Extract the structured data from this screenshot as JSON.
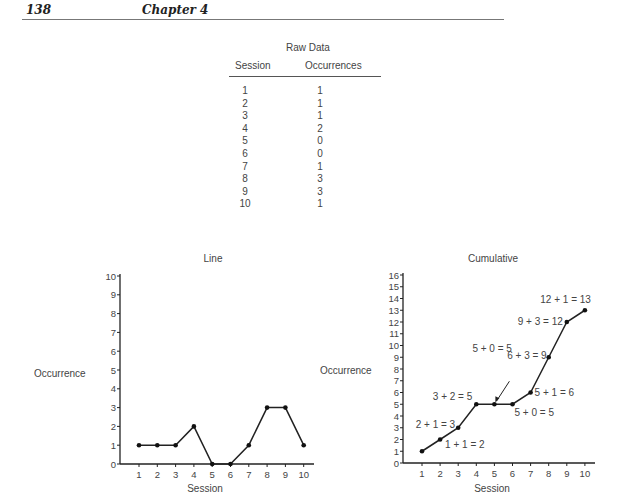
{
  "header": {
    "page_number": "138",
    "chapter": "Chapter 4"
  },
  "raw_data": {
    "title": "Raw Data",
    "columns": [
      "Session",
      "Occurrences"
    ],
    "rows": [
      [
        "1",
        "1"
      ],
      [
        "2",
        "1"
      ],
      [
        "3",
        "1"
      ],
      [
        "4",
        "2"
      ],
      [
        "5",
        "0"
      ],
      [
        "6",
        "0"
      ],
      [
        "7",
        "1"
      ],
      [
        "8",
        "3"
      ],
      [
        "9",
        "3"
      ],
      [
        "10",
        "1"
      ]
    ]
  },
  "chart_data": [
    {
      "type": "line",
      "title": "Line",
      "xlabel": "Session",
      "ylabel": "Occurrence",
      "x": [
        1,
        2,
        3,
        4,
        5,
        6,
        7,
        8,
        9,
        10
      ],
      "values": [
        1,
        1,
        1,
        2,
        0,
        0,
        1,
        3,
        3,
        1
      ],
      "ylim": [
        0,
        10
      ],
      "yticks": [
        0,
        1,
        2,
        3,
        4,
        5,
        6,
        7,
        8,
        9,
        10
      ],
      "xticks": [
        1,
        2,
        3,
        4,
        5,
        6,
        7,
        8,
        9,
        10
      ],
      "grid": false
    },
    {
      "type": "line",
      "title": "Cumulative",
      "xlabel": "Session",
      "ylabel": "Occurrence",
      "x": [
        1,
        2,
        3,
        4,
        5,
        6,
        7,
        8,
        9,
        10
      ],
      "values": [
        1,
        2,
        3,
        5,
        5,
        5,
        6,
        9,
        12,
        13
      ],
      "ylim": [
        0,
        16
      ],
      "yticks": [
        0,
        1,
        2,
        3,
        4,
        5,
        6,
        7,
        8,
        9,
        10,
        11,
        12,
        13,
        14,
        15,
        16
      ],
      "xticks": [
        1,
        2,
        3,
        4,
        5,
        6,
        7,
        8,
        9,
        10
      ],
      "grid": false,
      "annotations": [
        {
          "text": "1 + 1 = 2",
          "x": 2,
          "y": 2
        },
        {
          "text": "2 + 1 = 3",
          "x": 3,
          "y": 3
        },
        {
          "text": "3 + 2 = 5",
          "x": 4,
          "y": 5
        },
        {
          "text": "5 + 0 = 5",
          "x": 5,
          "y": 5
        },
        {
          "text": "5 + 0 = 5",
          "x": 6,
          "y": 5
        },
        {
          "text": "5 + 1 = 6",
          "x": 7,
          "y": 6
        },
        {
          "text": "6 + 3 = 9",
          "x": 8,
          "y": 9
        },
        {
          "text": "9 + 3 = 12",
          "x": 9,
          "y": 12
        },
        {
          "text": "12 + 1 = 13",
          "x": 10,
          "y": 13
        }
      ]
    }
  ]
}
